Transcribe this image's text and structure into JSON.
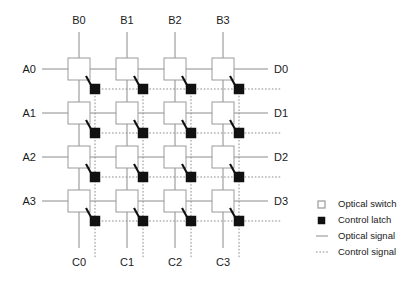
{
  "diagram": {
    "canvas": {
      "width": 416,
      "height": 292
    },
    "grid": {
      "rows": 4,
      "cols": 4,
      "box_size": 22,
      "col_x": [
        68,
        116,
        164,
        212
      ],
      "row_y": [
        58,
        102,
        146,
        190
      ],
      "latch_size": 10,
      "latch_offset_x": 22,
      "latch_offset_y": 26
    },
    "labels": {
      "top": [
        "B0",
        "B1",
        "B2",
        "B3"
      ],
      "left": [
        "A0",
        "A1",
        "A2",
        "A3"
      ],
      "right": [
        "D0",
        "D1",
        "D2",
        "D3"
      ],
      "bottom": [
        "C0",
        "C1",
        "C2",
        "C3"
      ]
    },
    "lines": {
      "top_stem_y": 32,
      "bottom_stem_y": 248,
      "left_stem_x": 42,
      "right_stem_x": 268,
      "control_h_end_x": 282,
      "control_v_end_y": 258
    },
    "colors": {
      "optical_signal": "#8c8c8c",
      "control_signal": "#8c8c8c",
      "switch_fill": "#ffffff",
      "switch_stroke": "#9a9a9a",
      "latch_fill": "#111111",
      "text": "#1a1a1a"
    }
  },
  "legend": {
    "x": 318,
    "y": 206,
    "row_height": 16,
    "items": [
      {
        "label": "Optical switch",
        "marker": "switch-swatch-icon"
      },
      {
        "label": "Control latch",
        "marker": "latch-swatch-icon"
      },
      {
        "label": "Optical signal",
        "marker": "solid-line-icon"
      },
      {
        "label": "Control signal",
        "marker": "dotted-line-icon"
      }
    ]
  }
}
